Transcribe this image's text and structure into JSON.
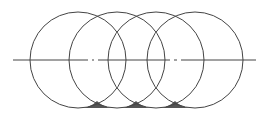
{
  "diagram": {
    "type": "overlapping-circles",
    "stroke_color": "#444444",
    "fill_color": "#555555",
    "centerline": {
      "y": 60,
      "x_start": 13,
      "x_end": 256,
      "gaps": [
        [
          88,
          92
        ],
        [
          94,
          98
        ],
        [
          170,
          174
        ],
        [
          177,
          181
        ]
      ]
    },
    "circles": [
      {
        "cx": 78,
        "cy": 60,
        "r": 48
      },
      {
        "cx": 117,
        "cy": 60,
        "r": 48
      },
      {
        "cx": 156,
        "cy": 60,
        "r": 48
      },
      {
        "cx": 195,
        "cy": 60,
        "r": 48
      }
    ],
    "base_line_y": 108,
    "shaded_cusps": [
      {
        "x_left": 82,
        "x_mid": 97,
        "x_right": 112
      },
      {
        "x_left": 121,
        "x_mid": 136,
        "x_right": 151
      },
      {
        "x_left": 160,
        "x_mid": 175,
        "x_right": 190
      }
    ]
  }
}
